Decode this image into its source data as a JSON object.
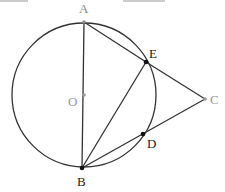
{
  "diagram": {
    "circle": {
      "center": "O",
      "cx": 84,
      "cy": 95,
      "r": 72
    },
    "points": [
      {
        "id": "A",
        "label": "A",
        "x": 84,
        "y": 22,
        "lx": 79,
        "ly": 13,
        "color": "#888888"
      },
      {
        "id": "O",
        "label": "O",
        "x": 84,
        "y": 95,
        "lx": 68,
        "ly": 106,
        "color": "#999999"
      },
      {
        "id": "E",
        "label": "E",
        "x": 146,
        "y": 62,
        "lx": 149,
        "ly": 58,
        "color": "#222222"
      },
      {
        "id": "C",
        "label": "C",
        "x": 205,
        "y": 99,
        "lx": 210,
        "ly": 104,
        "color": "#999999"
      },
      {
        "id": "D",
        "label": "D",
        "x": 143,
        "y": 134,
        "lx": 147,
        "ly": 148,
        "color": "#222222"
      },
      {
        "id": "B",
        "label": "B",
        "x": 82,
        "y": 168,
        "lx": 77,
        "ly": 186,
        "color": "#222222"
      }
    ],
    "segments": [
      "AB",
      "AE",
      "BE",
      "EC",
      "BC"
    ],
    "top_fragments": [
      {
        "x1": 0,
        "x2": 28,
        "y": 1
      },
      {
        "x1": 123,
        "x2": 165,
        "y": 1
      }
    ],
    "colors": {
      "line": "#333333",
      "label_dark": "#222222",
      "label_light": "#999999"
    }
  }
}
